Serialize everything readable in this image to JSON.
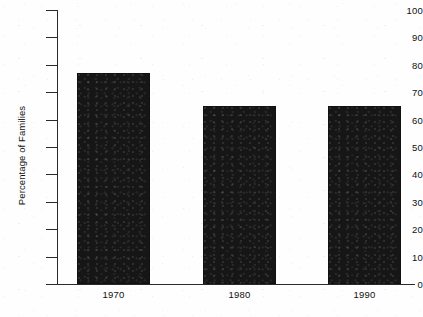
{
  "chart_data": {
    "type": "bar",
    "title": "",
    "subtitle": "",
    "xlabel": "",
    "ylabel": "Percentage of Families",
    "categories": [
      "1970",
      "1980",
      "1990"
    ],
    "values": [
      77,
      65,
      65
    ],
    "series": [
      {
        "name": "Percentage of Families",
        "values": [
          77,
          65,
          65
        ]
      }
    ],
    "ylim": [
      0,
      100
    ],
    "yticks": [
      0,
      10,
      20,
      30,
      40,
      50,
      60,
      70,
      80,
      90,
      100
    ],
    "ytick_labels": [
      "0",
      "10",
      "20",
      "30",
      "40",
      "50",
      "60",
      "70",
      "80",
      "90",
      "100"
    ],
    "xtick_labels": [
      "1970",
      "1980",
      "1990"
    ],
    "grid": false,
    "legend": false,
    "legend_position": "none",
    "bar_color": "#161616",
    "axis_color": "#2a2a2a",
    "background_color": "#ffffff",
    "annotations": []
  },
  "figure": {
    "y_axis_title": "Percentage of Families",
    "caption_partial": ""
  }
}
